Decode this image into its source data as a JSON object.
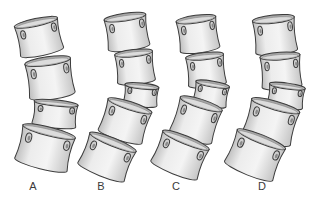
{
  "figure": {
    "colors": {
      "body_light": "#f2f2f2",
      "body_mid": "#d9d9d9",
      "body_dark": "#a8a8a8",
      "outline": "#3c3c3c",
      "label": "#3a3a3a"
    },
    "panels": [
      {
        "label": "A",
        "label_x": 33,
        "vertebrae": [
          {
            "cx": 39,
            "cy": 37,
            "w": 44,
            "h": 30,
            "rot": -12
          },
          {
            "cx": 50,
            "cy": 78,
            "w": 46,
            "h": 34,
            "rot": -8
          },
          {
            "cx": 55,
            "cy": 114,
            "w": 44,
            "h": 22,
            "rot": 6
          },
          {
            "cx": 45,
            "cy": 148,
            "w": 54,
            "h": 34,
            "rot": 14
          }
        ]
      },
      {
        "label": "B",
        "label_x": 101,
        "vertebrae": [
          {
            "cx": 127,
            "cy": 32,
            "w": 42,
            "h": 30,
            "rot": -8
          },
          {
            "cx": 135,
            "cy": 67,
            "w": 38,
            "h": 28,
            "rot": -6
          },
          {
            "cx": 141,
            "cy": 95,
            "w": 34,
            "h": 18,
            "rot": 6
          },
          {
            "cx": 125,
            "cy": 121,
            "w": 46,
            "h": 32,
            "rot": 18
          },
          {
            "cx": 107,
            "cy": 157,
            "w": 50,
            "h": 32,
            "rot": 22
          }
        ]
      },
      {
        "label": "C",
        "label_x": 176,
        "vertebrae": [
          {
            "cx": 198,
            "cy": 34,
            "w": 40,
            "h": 30,
            "rot": -8
          },
          {
            "cx": 206,
            "cy": 70,
            "w": 38,
            "h": 28,
            "rot": -6
          },
          {
            "cx": 211,
            "cy": 94,
            "w": 34,
            "h": 20,
            "rot": 10
          },
          {
            "cx": 196,
            "cy": 120,
            "w": 44,
            "h": 34,
            "rot": 18
          },
          {
            "cx": 180,
            "cy": 155,
            "w": 50,
            "h": 32,
            "rot": 22
          }
        ]
      },
      {
        "label": "D",
        "label_x": 262,
        "vertebrae": [
          {
            "cx": 275,
            "cy": 35,
            "w": 42,
            "h": 32,
            "rot": -6
          },
          {
            "cx": 281,
            "cy": 71,
            "w": 40,
            "h": 30,
            "rot": -4
          },
          {
            "cx": 286,
            "cy": 96,
            "w": 36,
            "h": 20,
            "rot": 8
          },
          {
            "cx": 271,
            "cy": 122,
            "w": 50,
            "h": 34,
            "rot": 16
          },
          {
            "cx": 255,
            "cy": 155,
            "w": 52,
            "h": 34,
            "rot": 22
          }
        ]
      }
    ]
  }
}
